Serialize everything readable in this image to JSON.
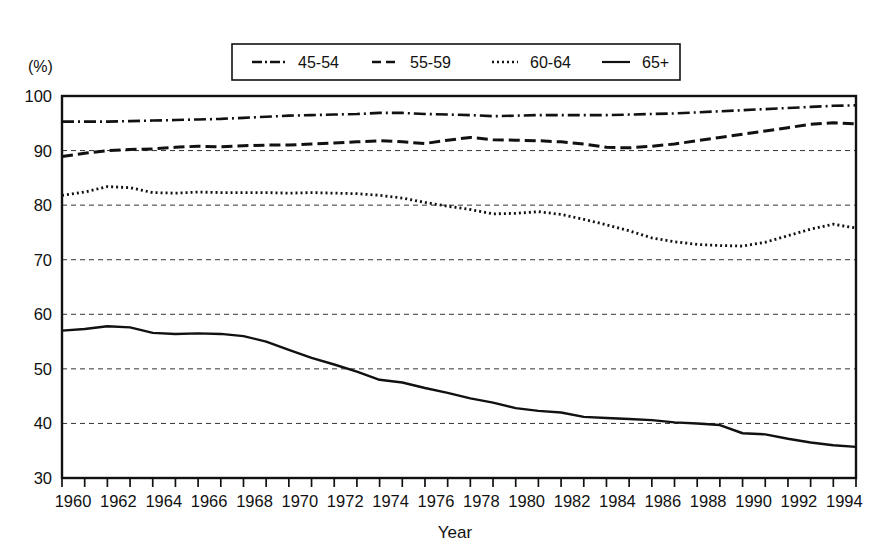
{
  "chart_data": {
    "type": "line",
    "title": "",
    "xlabel": "Year",
    "ylabel": "",
    "unit_label": "(%)",
    "xlim": [
      1960,
      1995
    ],
    "ylim": [
      30,
      100
    ],
    "grid": true,
    "grid_axis": "y",
    "legend_position": "top-center",
    "y_ticks": [
      30,
      40,
      50,
      60,
      70,
      80,
      90,
      100
    ],
    "y_tick_labels": [
      "30",
      "40",
      "50",
      "60",
      "70",
      "80",
      "90",
      "100"
    ],
    "x_tick_labels": [
      "1960",
      "1962",
      "1964",
      "1966",
      "1968",
      "1970",
      "1972",
      "1974",
      "1976",
      "1978",
      "1980",
      "1982",
      "1984",
      "1986",
      "1988",
      "1990",
      "1992",
      "1994"
    ],
    "x_tick_values": [
      1960,
      1962,
      1964,
      1966,
      1968,
      1970,
      1972,
      1974,
      1976,
      1978,
      1980,
      1982,
      1984,
      1986,
      1988,
      1990,
      1992,
      1994
    ],
    "x_minor_ticks": [
      1960,
      1961,
      1962,
      1963,
      1964,
      1965,
      1966,
      1967,
      1968,
      1969,
      1970,
      1971,
      1972,
      1973,
      1974,
      1975,
      1976,
      1977,
      1978,
      1979,
      1980,
      1981,
      1982,
      1983,
      1984,
      1985,
      1986,
      1987,
      1988,
      1989,
      1990,
      1991,
      1992,
      1993,
      1994,
      1995
    ],
    "x": [
      1960,
      1961,
      1962,
      1963,
      1964,
      1965,
      1966,
      1967,
      1968,
      1969,
      1970,
      1971,
      1972,
      1973,
      1974,
      1975,
      1976,
      1977,
      1978,
      1979,
      1980,
      1981,
      1982,
      1983,
      1984,
      1985,
      1986,
      1987,
      1988,
      1989,
      1990,
      1991,
      1992,
      1993,
      1994,
      1995
    ],
    "series": [
      {
        "name": "45-54",
        "dash": "12,4,2,4",
        "width": 2.6,
        "values": [
          95.3,
          95.3,
          95.3,
          95.4,
          95.5,
          95.6,
          95.7,
          95.8,
          96.0,
          96.2,
          96.4,
          96.5,
          96.6,
          96.7,
          96.9,
          96.9,
          96.7,
          96.6,
          96.5,
          96.3,
          96.4,
          96.5,
          96.5,
          96.5,
          96.5,
          96.6,
          96.7,
          96.8,
          97.0,
          97.2,
          97.4,
          97.6,
          97.8,
          98.0,
          98.2,
          98.3
        ]
      },
      {
        "name": "55-59",
        "dash": "11,5",
        "width": 3.0,
        "values": [
          88.9,
          89.5,
          90.0,
          90.2,
          90.3,
          90.6,
          90.8,
          90.7,
          90.9,
          91.0,
          91.0,
          91.2,
          91.4,
          91.6,
          91.8,
          91.6,
          91.3,
          91.9,
          92.4,
          92.0,
          91.9,
          91.8,
          91.6,
          91.2,
          90.6,
          90.5,
          90.8,
          91.2,
          91.8,
          92.4,
          93.0,
          93.6,
          94.2,
          94.8,
          95.1,
          94.9
        ]
      },
      {
        "name": "60-64",
        "dash": "2,3",
        "width": 2.8,
        "values": [
          81.8,
          82.4,
          83.4,
          83.2,
          82.3,
          82.2,
          82.4,
          82.3,
          82.3,
          82.3,
          82.2,
          82.3,
          82.2,
          82.1,
          81.8,
          81.3,
          80.5,
          79.8,
          79.2,
          78.4,
          78.5,
          78.8,
          78.3,
          77.4,
          76.4,
          75.3,
          74.0,
          73.3,
          72.8,
          72.6,
          72.5,
          73.2,
          74.4,
          75.6,
          76.5,
          75.8
        ]
      },
      {
        "name": "65+",
        "dash": "",
        "width": 2.4,
        "values": [
          57.0,
          57.3,
          57.8,
          57.6,
          56.6,
          56.4,
          56.5,
          56.4,
          56.0,
          55.0,
          53.5,
          52.0,
          50.8,
          49.5,
          48.0,
          47.5,
          46.5,
          45.6,
          44.6,
          43.8,
          42.8,
          42.3,
          42.0,
          41.2,
          41.0,
          40.8,
          40.6,
          40.2,
          40.0,
          39.7,
          38.2,
          38.0,
          37.2,
          36.5,
          36.0,
          35.7
        ]
      }
    ],
    "series_65plus_note": "65+ continues declining to a minimum near 1987 then recovers",
    "colors": {
      "ink": "#111111",
      "background": "#ffffff",
      "grid": "#333333"
    }
  },
  "legend": {
    "items": [
      {
        "label": "45-54",
        "dash": "10,3,2,3"
      },
      {
        "label": "55-59",
        "dash": "9,5"
      },
      {
        "label": "60-64",
        "dash": "2,3"
      },
      {
        "label": "65+",
        "dash": ""
      }
    ]
  }
}
